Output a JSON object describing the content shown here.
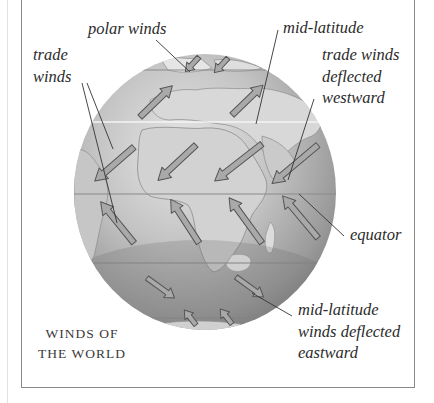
{
  "diagram": {
    "title": [
      "WINDS OF",
      "THE WORLD"
    ],
    "cut_off_top_text": "",
    "labels": {
      "polar_winds": "polar winds",
      "trade_winds": [
        "trade",
        "winds"
      ],
      "mid_latitude": "mid-latitude",
      "trade_winds_deflected": [
        "trade winds",
        "deflected",
        "westward"
      ],
      "equator": "equator",
      "mid_latitude_deflected": [
        "mid-latitude",
        "winds deflected",
        "eastward"
      ]
    },
    "globe": {
      "center": [
        205,
        192
      ],
      "radius": [
        131,
        138
      ],
      "equator_y": 194,
      "latitude_lines_y": [
        70,
        122,
        194,
        263,
        318
      ]
    },
    "arrow_groups": [
      {
        "name": "northern polar easterlies",
        "direction": "southwest",
        "count": 2
      },
      {
        "name": "northern mid-latitude westerlies",
        "direction": "northeast",
        "count": 2
      },
      {
        "name": "northern trade winds",
        "direction": "southwest",
        "count": 4
      },
      {
        "name": "southern trade winds",
        "direction": "northwest",
        "count": 4
      },
      {
        "name": "southern mid-latitude westerlies",
        "direction": "southeast",
        "count": 2
      },
      {
        "name": "southern polar easterlies",
        "direction": "northwest",
        "count": 2
      }
    ],
    "colors": {
      "ocean_light": "#d9d9d9",
      "ocean_dark": "#7a7a7a",
      "land": "#cfcfcf",
      "arrow_fill": "#a9a9a9",
      "arrow_stroke": "#5a5a5a",
      "text": "#2b2b2b",
      "frame": "#8a8a8a"
    }
  }
}
